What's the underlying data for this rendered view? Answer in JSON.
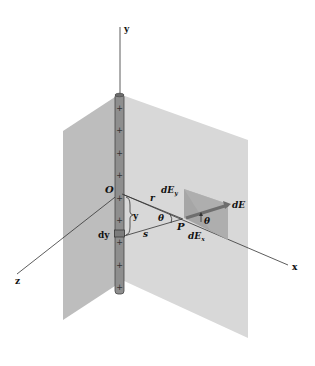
{
  "figure": {
    "labels": {
      "y_axis": "y",
      "x_axis": "x",
      "z_axis": "z",
      "origin": "O",
      "point": "P",
      "r": "r",
      "s": "s",
      "y_dist": "y",
      "dy": "dy",
      "theta_left": "θ",
      "theta_right": "θ",
      "dE": "dE",
      "dEy": "dE",
      "dEy_sub": "y",
      "dEx": "dE",
      "dEx_sub": "x"
    },
    "charge_sign": "+",
    "charge_count": 9,
    "colors": {
      "plane_left": "#b9b9b9",
      "plane_right": "#d6d6d6",
      "rod": "#8c8c8c",
      "vector_plane": "#a8a8a8",
      "vector": "#7a7a7a"
    }
  }
}
